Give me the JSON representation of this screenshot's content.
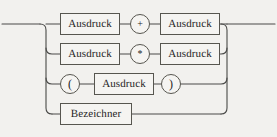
{
  "diagram": {
    "kind": "railroad-syntax-diagram",
    "title": "Ausdruck",
    "language": "de",
    "colors": {
      "background": "#f2f1ee",
      "rail": "#4a4a48",
      "box_border": "#57564f",
      "box_fill": "#f5f4f1",
      "text": "#26251f"
    },
    "entry": {
      "label": "",
      "x": 0,
      "y": 24
    },
    "exit": {
      "label": "",
      "x": 277,
      "y": 24
    },
    "left_spine_x": 46,
    "right_spine_x": 227,
    "branches": [
      {
        "id": "branch-addition",
        "y": 24,
        "nodes": [
          {
            "type": "nonterminal",
            "label": "Ausdruck",
            "x": 60,
            "y": 13,
            "w": 60,
            "h": 22
          },
          {
            "type": "terminal",
            "label": "+",
            "x": 130,
            "y": 14,
            "d": 20
          },
          {
            "type": "nonterminal",
            "label": "Ausdruck",
            "x": 160,
            "y": 13,
            "w": 60,
            "h": 22
          }
        ]
      },
      {
        "id": "branch-multiplication",
        "y": 54,
        "nodes": [
          {
            "type": "nonterminal",
            "label": "Ausdruck",
            "x": 60,
            "y": 43,
            "w": 60,
            "h": 22
          },
          {
            "type": "terminal",
            "label": "*",
            "x": 130,
            "y": 44,
            "d": 20
          },
          {
            "type": "nonterminal",
            "label": "Ausdruck",
            "x": 160,
            "y": 43,
            "w": 60,
            "h": 22
          }
        ]
      },
      {
        "id": "branch-parenthesized",
        "y": 84,
        "nodes": [
          {
            "type": "terminal",
            "label": "(",
            "x": 60,
            "y": 74,
            "d": 20
          },
          {
            "type": "nonterminal",
            "label": "Ausdruck",
            "x": 94,
            "y": 73,
            "w": 60,
            "h": 22
          },
          {
            "type": "terminal",
            "label": ")",
            "x": 161,
            "y": 74,
            "d": 20
          }
        ]
      },
      {
        "id": "branch-identifier",
        "y": 114,
        "nodes": [
          {
            "type": "nonterminal",
            "label": "Bezeichner",
            "x": 60,
            "y": 103,
            "w": 72,
            "h": 22
          }
        ]
      }
    ]
  }
}
